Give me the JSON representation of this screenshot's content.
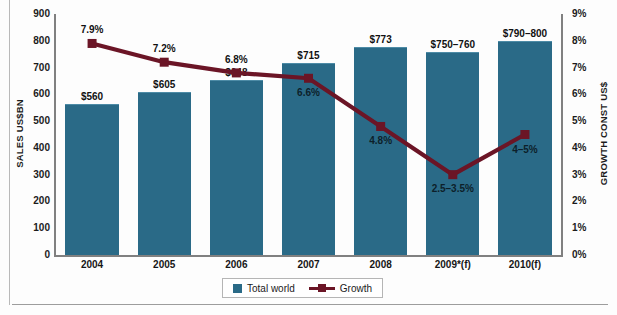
{
  "chart_data": {
    "type": "bar",
    "title": "",
    "subtitle": "",
    "xlabel": "",
    "ylabel": "SALES US$BN",
    "y2label": "GROWTH CONST US$",
    "ylim": [
      0,
      900
    ],
    "y2lim": [
      0,
      9
    ],
    "grid": false,
    "legend_position": "bottom-center",
    "categories": [
      "2004",
      "2005",
      "2006",
      "2007",
      "2008",
      "2009*(f)",
      "2010(f)"
    ],
    "y_ticks": [
      "900",
      "800",
      "700",
      "600",
      "500",
      "400",
      "300",
      "200",
      "100",
      "0"
    ],
    "y2_ticks": [
      "9%",
      "8%",
      "7%",
      "6%",
      "5%",
      "4%",
      "3%",
      "2%",
      "1%",
      "0%"
    ],
    "series": [
      {
        "name": "Total world",
        "type": "bar",
        "axis": "left",
        "color": "#2a6a87",
        "values": [
          560,
          605,
          648,
          715,
          773,
          755,
          795
        ],
        "value_labels": [
          "$560",
          "$605",
          "$648",
          "$715",
          "$773",
          "$750–760",
          "$790–800"
        ]
      },
      {
        "name": "Growth",
        "type": "line",
        "axis": "right",
        "color": "#6b1526",
        "values": [
          7.9,
          7.2,
          6.8,
          6.6,
          4.8,
          3.0,
          4.5
        ],
        "value_labels": [
          "7.9%",
          "7.2%",
          "6.8%",
          "6.6%",
          "4.8%",
          "2.5–3.5%",
          "4–5%"
        ],
        "label_placement": [
          "above",
          "above",
          "above",
          "inbar",
          "inbar",
          "below",
          "inbar"
        ]
      }
    ]
  },
  "legend": {
    "items": [
      {
        "label": "Total world",
        "marker": "bar-swatch-icon"
      },
      {
        "label": "Growth",
        "marker": "line-marker-icon"
      }
    ]
  },
  "colors": {
    "bar": "#2a6a87",
    "bar_top_highlight": "#4d8ba6",
    "line": "#6b1526",
    "axis": "#808080",
    "text": "#1b1b1b",
    "page": "#fdfdfd"
  }
}
